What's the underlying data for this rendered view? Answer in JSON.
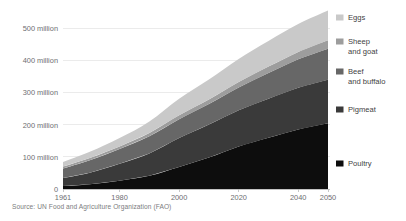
{
  "chart_data": {
    "type": "area",
    "stacked": true,
    "title": "",
    "subtitle": "",
    "xlabel": "",
    "ylabel": "",
    "x": [
      1961,
      1970,
      1980,
      1990,
      2000,
      2010,
      2020,
      2030,
      2040,
      2050
    ],
    "xlim": [
      1961,
      2050
    ],
    "ylim": [
      0,
      540
    ],
    "y_unit": "million",
    "xticks": [
      "1961",
      "1980",
      "2000",
      "2020",
      "2040",
      "2050"
    ],
    "xtick_values": [
      1961,
      1980,
      2000,
      2020,
      2040,
      2050
    ],
    "yticks": [
      "0",
      "100 million",
      "200 million",
      "300 million",
      "400 million",
      "500 million"
    ],
    "ytick_values": [
      0,
      100,
      200,
      300,
      400,
      500
    ],
    "grid": true,
    "legend_position": "right",
    "series": [
      {
        "name": "Poultry",
        "color": "#0d0d0d",
        "values": [
          9,
          15,
          26,
          41,
          69,
          98,
          133,
          160,
          186,
          205
        ]
      },
      {
        "name": "Pigmeat",
        "color": "#3a3a3a",
        "values": [
          25,
          36,
          53,
          70,
          90,
          103,
          113,
          122,
          130,
          136
        ]
      },
      {
        "name": "Beef and buffalo",
        "color": "#676767",
        "values": [
          30,
          39,
          46,
          54,
          59,
          64,
          71,
          80,
          89,
          97
        ]
      },
      {
        "name": "Sheep and goat",
        "color": "#9d9d9d",
        "values": [
          6,
          7,
          8,
          10,
          12,
          14,
          17,
          20,
          23,
          26
        ]
      },
      {
        "name": "Eggs",
        "color": "#c9c9c9",
        "values": [
          14,
          19,
          26,
          36,
          52,
          63,
          72,
          80,
          87,
          93
        ]
      }
    ]
  },
  "legend": {
    "items": [
      {
        "label_line1": "Eggs",
        "label_line2": "",
        "color": "#c9c9c9"
      },
      {
        "label_line1": "Sheep",
        "label_line2": "and goat",
        "color": "#9d9d9d"
      },
      {
        "label_line1": "Beef",
        "label_line2": "and buffalo",
        "color": "#676767"
      },
      {
        "label_line1": "Pigmeat",
        "label_line2": "",
        "color": "#3a3a3a"
      },
      {
        "label_line1": "Poultry",
        "label_line2": "",
        "color": "#0d0d0d"
      }
    ]
  },
  "footer": {
    "source": "Source: UN Food and Agriculture Organization (FAO)"
  },
  "colors": {
    "background": "#ffffff",
    "grid": "#e3e3e3",
    "axis": "#b9b9b9",
    "tick_text": "#6d6e71",
    "legend_text": "#3f3f3f",
    "source_text": "#7b7c7e"
  }
}
